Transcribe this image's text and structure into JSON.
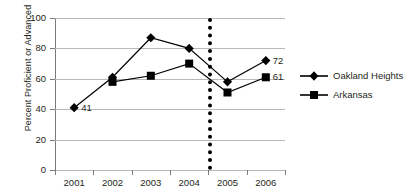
{
  "chart_data": {
    "type": "line",
    "title": "",
    "xlabel": "",
    "ylabel": "Percent Proficient or Advanced",
    "categories": [
      "2001",
      "2002",
      "2003",
      "2004",
      "2005",
      "2006"
    ],
    "x_tick_labels": [
      "2001",
      "2002",
      "2003",
      "2004",
      "2005",
      "2006"
    ],
    "y_tick_labels": [
      "0",
      "20",
      "40",
      "60",
      "80",
      "100"
    ],
    "y_ticks": [
      0,
      20,
      40,
      60,
      80,
      100
    ],
    "ylim": [
      0,
      100
    ],
    "grid": "horizontal",
    "legend_position": "right",
    "series": [
      {
        "name": "Oakland Heights",
        "marker": "diamond",
        "color": "#000000",
        "values": [
          41,
          61,
          87,
          80,
          58,
          72
        ]
      },
      {
        "name": "Arkansas",
        "marker": "square",
        "color": "#000000",
        "values": [
          null,
          58,
          62,
          70,
          51,
          61
        ]
      }
    ],
    "annotations": [
      {
        "text": "41",
        "series": "Oakland Heights",
        "category": "2001",
        "value": 41
      },
      {
        "text": "72",
        "series": "Oakland Heights",
        "category": "2006",
        "value": 72
      },
      {
        "text": "61",
        "series": "Arkansas",
        "category": "2006",
        "value": 61
      }
    ],
    "reference_lines": [
      {
        "orientation": "vertical",
        "between": [
          "2004",
          "2005"
        ],
        "style": "dotted",
        "color": "#000000"
      }
    ]
  },
  "legend": {
    "items": [
      {
        "label": "Oakland Heights",
        "marker": "diamond"
      },
      {
        "label": "Arkansas",
        "marker": "square"
      }
    ]
  }
}
